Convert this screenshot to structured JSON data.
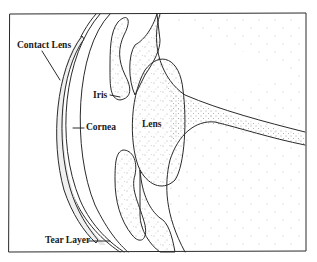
{
  "diagram": {
    "labels": {
      "contact_lens": "Contact Lens",
      "iris": "Iris",
      "cornea": "Cornea",
      "lens": "Lens",
      "tear_layer": "Tear Layer"
    },
    "colors": {
      "line": "#2a2a2a",
      "stipple": "#555555",
      "tear_fill": "#e6e6e6",
      "background": "#ffffff"
    }
  }
}
